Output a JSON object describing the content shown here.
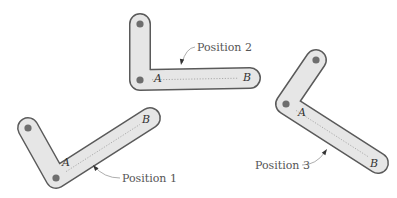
{
  "colors": {
    "background": "#ffffff",
    "link_fill": "#e6e6e6",
    "link_stroke": "#5a5a5a",
    "pin": "#6e6e6e",
    "centerline": "#9a9a9a",
    "leader": "#8a8a8a",
    "arrow": "#333333",
    "text": "#555555"
  },
  "link_width": 20,
  "pin_radius": 3.6,
  "positions": [
    {
      "name": "position-1",
      "label": "Position 1",
      "pivot_top": [
        28,
        128
      ],
      "joint_A": [
        56,
        178
      ],
      "end_B": [
        150,
        118
      ],
      "label_A": "A",
      "label_A_pos": [
        62,
        166
      ],
      "label_B": "B",
      "label_B_pos": [
        142,
        123
      ],
      "label_pos": [
        122,
        182
      ],
      "leader": "M120,178 Q104,178 94,166",
      "arrow": [
        93,
        165,
        -130
      ]
    },
    {
      "name": "position-2",
      "label": "Position 2",
      "pivot_top": [
        140,
        24
      ],
      "joint_A": [
        140,
        80
      ],
      "end_B": [
        250,
        78
      ],
      "label_A": "A",
      "label_A_pos": [
        154,
        82
      ],
      "label_B": "B",
      "label_B_pos": [
        243,
        81
      ],
      "label_pos": [
        197,
        51
      ],
      "leader": "M195,47 Q186,48 182,63",
      "arrow": [
        181,
        65,
        100
      ]
    },
    {
      "name": "position-3",
      "label": "Position 3",
      "pivot_top": [
        316,
        60
      ],
      "joint_A": [
        286,
        104
      ],
      "end_B": [
        378,
        163
      ],
      "label_A": "A",
      "label_A_pos": [
        298,
        116
      ],
      "label_B": "B",
      "label_B_pos": [
        370,
        167
      ],
      "label_pos": [
        255,
        169
      ],
      "leader": "M302,165 Q316,165 325,152",
      "arrow": [
        327,
        149,
        -55
      ]
    }
  ]
}
